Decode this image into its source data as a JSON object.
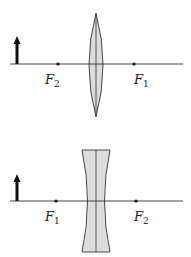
{
  "diagram": {
    "top": {
      "type": "converging-lens",
      "left_focus": {
        "letter": "F",
        "sub": "2"
      },
      "right_focus": {
        "letter": "F",
        "sub": "1"
      }
    },
    "bottom": {
      "type": "diverging-lens",
      "left_focus": {
        "letter": "F",
        "sub": "1"
      },
      "right_focus": {
        "letter": "F",
        "sub": "2"
      }
    },
    "colors": {
      "lens_fill": "#dcdcdc",
      "line": "#333333",
      "arrow": "#111111"
    }
  }
}
